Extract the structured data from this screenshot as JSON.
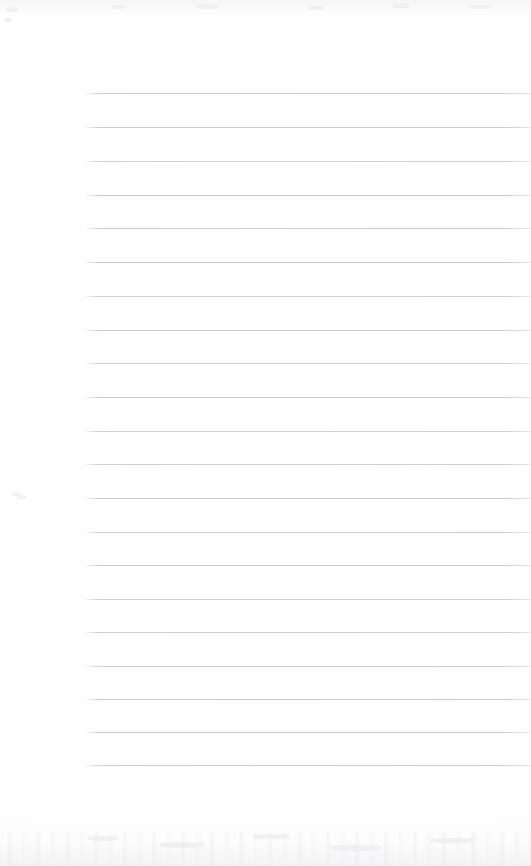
{
  "page": {
    "width": 531,
    "height": 866,
    "background_color": "#fefefe",
    "content_text": "",
    "is_blank": true
  },
  "ruling": {
    "name": "horizontal-ruled-lines",
    "line_color": "#c9c9cd",
    "line_thickness_px": 1,
    "line_count": 21,
    "left_margin_x": 85,
    "right_edge_x": 531,
    "first_line_y": 93,
    "last_line_y": 765,
    "line_spacing_px": 33.6,
    "lines": [
      {
        "y": 93,
        "x": 85,
        "width": 446,
        "opacity": 0.92
      },
      {
        "y": 127,
        "x": 85,
        "width": 446,
        "opacity": 0.95
      },
      {
        "y": 161,
        "x": 85,
        "width": 446,
        "opacity": 0.88
      },
      {
        "y": 195,
        "x": 85,
        "width": 446,
        "opacity": 0.93
      },
      {
        "y": 228,
        "x": 85,
        "width": 446,
        "opacity": 0.9
      },
      {
        "y": 262,
        "x": 85,
        "width": 446,
        "opacity": 0.95
      },
      {
        "y": 296,
        "x": 85,
        "width": 446,
        "opacity": 0.9
      },
      {
        "y": 330,
        "x": 85,
        "width": 446,
        "opacity": 0.93
      },
      {
        "y": 363,
        "x": 85,
        "width": 446,
        "opacity": 0.88
      },
      {
        "y": 397,
        "x": 85,
        "width": 446,
        "opacity": 0.94
      },
      {
        "y": 431,
        "x": 85,
        "width": 446,
        "opacity": 0.9
      },
      {
        "y": 464,
        "x": 85,
        "width": 446,
        "opacity": 0.92
      },
      {
        "y": 498,
        "x": 85,
        "width": 446,
        "opacity": 0.95
      },
      {
        "y": 532,
        "x": 85,
        "width": 446,
        "opacity": 0.88
      },
      {
        "y": 565,
        "x": 85,
        "width": 446,
        "opacity": 0.93
      },
      {
        "y": 599,
        "x": 85,
        "width": 446,
        "opacity": 0.9
      },
      {
        "y": 632,
        "x": 85,
        "width": 446,
        "opacity": 0.94
      },
      {
        "y": 666,
        "x": 85,
        "width": 446,
        "opacity": 0.9
      },
      {
        "y": 699,
        "x": 85,
        "width": 446,
        "opacity": 0.92
      },
      {
        "y": 732,
        "x": 85,
        "width": 446,
        "opacity": 0.88
      },
      {
        "y": 765,
        "x": 85,
        "width": 446,
        "opacity": 0.9
      }
    ]
  },
  "artifacts": {
    "name": "scan-artifacts",
    "description": "faint bleed-through and scanner noise",
    "top_band": {
      "y": 0,
      "height": 26
    },
    "bottom_band": {
      "y": 818,
      "height": 48
    },
    "specks": [
      {
        "x": 17,
        "y": 495,
        "w": 9,
        "h": 4
      },
      {
        "x": 6,
        "y": 7,
        "w": 12,
        "h": 5
      },
      {
        "x": 4,
        "y": 18,
        "w": 8,
        "h": 4
      },
      {
        "x": 112,
        "y": 5,
        "w": 14,
        "h": 4
      },
      {
        "x": 196,
        "y": 4,
        "w": 22,
        "h": 5
      },
      {
        "x": 308,
        "y": 6,
        "w": 16,
        "h": 4
      },
      {
        "x": 392,
        "y": 3,
        "w": 18,
        "h": 5
      },
      {
        "x": 470,
        "y": 5,
        "w": 20,
        "h": 4
      },
      {
        "x": 88,
        "y": 836,
        "w": 30,
        "h": 5
      },
      {
        "x": 160,
        "y": 842,
        "w": 44,
        "h": 6
      },
      {
        "x": 252,
        "y": 834,
        "w": 38,
        "h": 5
      },
      {
        "x": 330,
        "y": 845,
        "w": 52,
        "h": 6
      },
      {
        "x": 430,
        "y": 838,
        "w": 46,
        "h": 5
      }
    ]
  }
}
